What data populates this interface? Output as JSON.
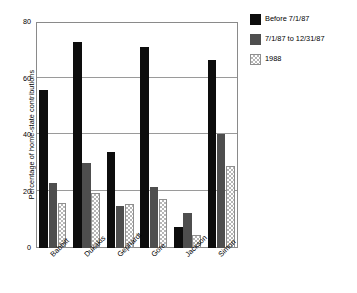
{
  "chart_data": {
    "type": "bar",
    "title": "",
    "xlabel": "",
    "ylabel": "Percentage of home-state contributions",
    "ylim": [
      0,
      80
    ],
    "yticks": [
      0,
      20,
      40,
      60,
      80
    ],
    "grid": true,
    "legend_position": "right",
    "categories": [
      "Babbitt",
      "Dukakis",
      "Gephardt",
      "Gore",
      "Jackson",
      "Simon"
    ],
    "series": [
      {
        "name": "Before 7/1/87",
        "color": "#0d0d0d",
        "fill": "solid-black",
        "values": [
          56,
          73,
          34,
          71,
          7.5,
          66.5
        ]
      },
      {
        "name": "7/1/87 to 12/31/87",
        "color": "#4e4e4e",
        "fill": "solid-gray",
        "values": [
          23,
          30,
          15,
          21.5,
          12.5,
          40.5
        ]
      },
      {
        "name": "1988",
        "color": "#b6b6b6",
        "fill": "checkered",
        "values": [
          16,
          19.5,
          15.5,
          17.5,
          4.5,
          29
        ]
      }
    ]
  },
  "legend": {
    "items": [
      {
        "label": "Before 7/1/87"
      },
      {
        "label": "7/1/87 to 12/31/87"
      },
      {
        "label": "1988"
      }
    ]
  },
  "axes": {
    "y_title": "Percentage of home-state contributions",
    "y_tick_labels": [
      "80",
      "60",
      "40",
      "20",
      "0"
    ],
    "x_tick_labels": [
      "Babbitt",
      "Dukakis",
      "Gephardt",
      "Gore",
      "Jackson",
      "Simon"
    ]
  }
}
